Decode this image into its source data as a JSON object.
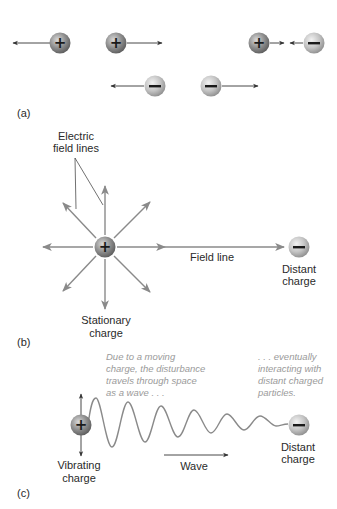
{
  "figure": {
    "panel_a": {
      "label": "(a)",
      "charges": [
        {
          "sign": "+",
          "cx": 60,
          "cy": 43,
          "arrow": "left",
          "arrow_to": 13
        },
        {
          "sign": "+",
          "cx": 116,
          "cy": 43,
          "arrow": "right",
          "arrow_to": 162
        },
        {
          "sign": "+",
          "cx": 259,
          "cy": 43,
          "arrow": "right",
          "arrow_to": 284
        },
        {
          "sign": "−",
          "cx": 314,
          "cy": 43,
          "arrow": "left",
          "arrow_to": 290
        },
        {
          "sign": "−",
          "cx": 155,
          "cy": 86,
          "arrow": "left",
          "arrow_to": 111
        },
        {
          "sign": "−",
          "cx": 211,
          "cy": 86,
          "arrow": "right",
          "arrow_to": 258
        }
      ]
    },
    "panel_b": {
      "label": "(b)",
      "field_lines_label_1": "Electric",
      "field_lines_label_2": "field lines",
      "field_line_label": "Field line",
      "distant_label_1": "Distant",
      "distant_label_2": "charge",
      "stationary_label_1": "Stationary",
      "stationary_label_2": "charge",
      "source_sign": "+",
      "distant_sign": "−"
    },
    "panel_c": {
      "label": "(c)",
      "note_left": [
        "Due to a moving",
        "charge, the disturbance",
        "travels through space",
        "as a wave . . ."
      ],
      "note_right": [
        ". . . eventually",
        "interacting with",
        "distant charged",
        "particles."
      ],
      "vibrating_label_1": "Vibrating",
      "vibrating_label_2": "charge",
      "wave_label": "Wave",
      "distant_label_1": "Distant",
      "distant_label_2": "charge",
      "source_sign": "+",
      "distant_sign": "−"
    },
    "colors": {
      "arrow_dark": "#333333",
      "field_arrow": "#8a8a8a",
      "plus_ball": "#8e8e8e",
      "minus_ball": "#c4c4c4",
      "note_text": "#9a9a9a"
    }
  }
}
